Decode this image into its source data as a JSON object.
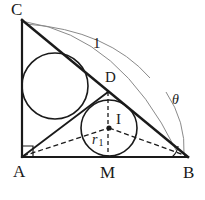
{
  "figure": {
    "canvas": {
      "width": 205,
      "height": 200
    },
    "colors": {
      "stroke_main": "#1a1a1a",
      "stroke_thin": "#8a8a8a",
      "stroke_dashed": "#1a1a1a",
      "background": "#ffffff",
      "label": "#1a1a1a"
    },
    "labels": {
      "vertex_c": "C",
      "vertex_a": "A",
      "vertex_b": "B",
      "point_d": "D",
      "point_i": "I",
      "point_m": "M",
      "length_hypotenuse": "1",
      "radius_incircle": "r",
      "radius_subscript": "1",
      "angle_theta": "θ"
    },
    "points": {
      "A": {
        "x": 22,
        "y": 157
      },
      "B": {
        "x": 188,
        "y": 157
      },
      "C": {
        "x": 22,
        "y": 20
      },
      "D": {
        "x": 108,
        "y": 92
      },
      "I": {
        "x": 109,
        "y": 128
      },
      "M": {
        "x": 108,
        "y": 157
      }
    },
    "circles": {
      "large": {
        "cx": 55,
        "cy": 86,
        "r": 33
      },
      "incircle": {
        "cx": 109,
        "cy": 128,
        "r": 28
      }
    },
    "segments": [
      {
        "name": "leg-AC",
        "from": "A",
        "to": "C",
        "style": "solid"
      },
      {
        "name": "leg-AB",
        "from": "A",
        "to": "B",
        "style": "solid"
      },
      {
        "name": "hypotenuse-CB",
        "from": "C",
        "to": "B",
        "style": "solid"
      },
      {
        "name": "cevian-AD",
        "from": "A",
        "to": "D",
        "style": "solid"
      },
      {
        "name": "segment-AI",
        "from": "A",
        "to": "I",
        "style": "dashed"
      },
      {
        "name": "segment-IB",
        "from": "I",
        "to": "B",
        "style": "dashed"
      },
      {
        "name": "segment-DM",
        "from": "D",
        "to": "M",
        "style": "dashed"
      }
    ],
    "marks": {
      "right_angle_at_A": true,
      "angle_arc_at_B": true,
      "length_arc_C_to_B": true
    }
  }
}
